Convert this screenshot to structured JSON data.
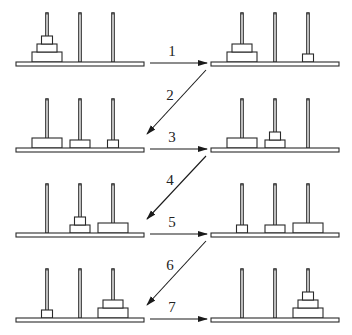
{
  "diagram": {
    "type": "tower-of-hanoi-steps",
    "colors": {
      "stroke": "#2a2a2a",
      "fill": "#ffffff",
      "peg_fill": "#bdbdbd"
    },
    "disks": {
      "L": {
        "width": 30,
        "height": 10
      },
      "M": {
        "width": 20,
        "height": 8
      },
      "S": {
        "width": 11,
        "height": 8
      }
    },
    "panel": {
      "base_width": 128,
      "base_height": 4,
      "peg_offsets": [
        31,
        64,
        97
      ],
      "peg_height": 49
    },
    "states": [
      {
        "id": "state-0",
        "x": 16,
        "base_y": 62,
        "pegs": [
          [
            "L",
            "M",
            "S"
          ],
          [],
          []
        ]
      },
      {
        "id": "state-1",
        "x": 211,
        "base_y": 62,
        "pegs": [
          [
            "L",
            "M"
          ],
          [],
          [
            "S"
          ]
        ]
      },
      {
        "id": "state-2",
        "x": 16,
        "base_y": 148,
        "pegs": [
          [
            "L"
          ],
          [
            "M"
          ],
          [
            "S"
          ]
        ]
      },
      {
        "id": "state-3",
        "x": 211,
        "base_y": 148,
        "pegs": [
          [
            "L"
          ],
          [
            "M",
            "S"
          ],
          []
        ]
      },
      {
        "id": "state-4",
        "x": 16,
        "base_y": 233,
        "pegs": [
          [],
          [
            "M",
            "S"
          ],
          [
            "L"
          ]
        ]
      },
      {
        "id": "state-5",
        "x": 211,
        "base_y": 233,
        "pegs": [
          [
            "S"
          ],
          [
            "M"
          ],
          [
            "L"
          ]
        ]
      },
      {
        "id": "state-6",
        "x": 16,
        "base_y": 318,
        "pegs": [
          [
            "S"
          ],
          [],
          [
            "L",
            "M"
          ]
        ]
      },
      {
        "id": "state-7",
        "x": 211,
        "base_y": 318,
        "pegs": [
          [],
          [],
          [
            "L",
            "M",
            "S"
          ]
        ]
      }
    ],
    "moves": [
      {
        "label": "1",
        "kind": "horizontal",
        "x1": 150,
        "y1": 63,
        "x2": 207,
        "y2": 63,
        "lx": 172,
        "ly": 56
      },
      {
        "label": "2",
        "kind": "diagonal",
        "x1": 206,
        "y1": 70,
        "x2": 147,
        "y2": 134,
        "lx": 170,
        "ly": 100
      },
      {
        "label": "3",
        "kind": "horizontal",
        "x1": 150,
        "y1": 149,
        "x2": 207,
        "y2": 149,
        "lx": 172,
        "ly": 142
      },
      {
        "label": "4",
        "kind": "diagonal",
        "x1": 206,
        "y1": 156,
        "x2": 147,
        "y2": 219,
        "lx": 170,
        "ly": 185
      },
      {
        "label": "5",
        "kind": "horizontal",
        "x1": 150,
        "y1": 234,
        "x2": 207,
        "y2": 234,
        "lx": 172,
        "ly": 227
      },
      {
        "label": "6",
        "kind": "diagonal",
        "x1": 206,
        "y1": 241,
        "x2": 147,
        "y2": 305,
        "lx": 170,
        "ly": 270
      },
      {
        "label": "7",
        "kind": "horizontal",
        "x1": 150,
        "y1": 319,
        "x2": 207,
        "y2": 319,
        "lx": 172,
        "ly": 312
      }
    ]
  }
}
